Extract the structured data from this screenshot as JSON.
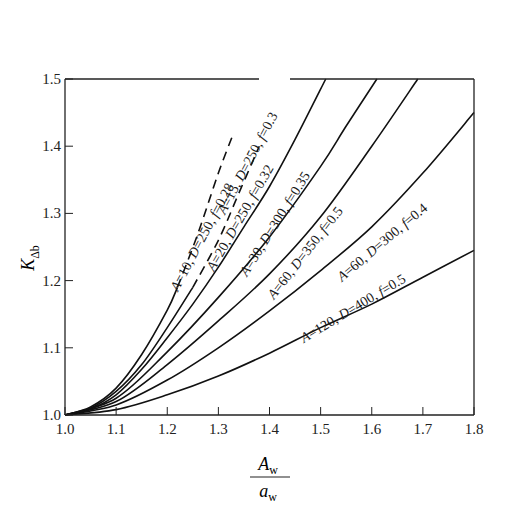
{
  "chart_data": {
    "type": "line",
    "title": "",
    "xlabel": "A_w / a_w",
    "xlabel_parts": {
      "numerator": "A",
      "numerator_sub": "w",
      "denominator": "a",
      "denominator_sub": "w"
    },
    "ylabel": "K_Δb",
    "ylabel_parts": {
      "main": "K",
      "sub": "Δb"
    },
    "xlim": [
      1.0,
      1.8
    ],
    "ylim": [
      1.0,
      1.5
    ],
    "x_ticks": [
      "1.0",
      "1.1",
      "1.2",
      "1.3",
      "1.4",
      "1.5",
      "1.6",
      "1.7",
      "1.8"
    ],
    "y_ticks": [
      "1.0",
      "1.1",
      "1.2",
      "1.3",
      "1.4",
      "1.5"
    ],
    "grid": false,
    "legend": "inline labels along curves",
    "series": [
      {
        "name": "A=10, D=250, f=0.28",
        "A": 10,
        "D": 250,
        "f": 0.28,
        "x": [
          1.0,
          1.05,
          1.1,
          1.15,
          1.2,
          1.22,
          1.26,
          1.3,
          1.33
        ],
        "values": [
          1.0,
          1.012,
          1.04,
          1.09,
          1.156,
          1.19,
          1.27,
          1.36,
          1.42
        ],
        "style": "solid to x≈1.22, dashed beyond",
        "dash_from_x": 1.22
      },
      {
        "name": "A=15, D=250, f=0.3",
        "A": 15,
        "D": 250,
        "f": 0.3,
        "x": [
          1.0,
          1.05,
          1.1,
          1.15,
          1.2,
          1.25,
          1.3,
          1.34,
          1.38
        ],
        "values": [
          1.0,
          1.01,
          1.035,
          1.075,
          1.13,
          1.19,
          1.26,
          1.33,
          1.4
        ],
        "style": "solid to x≈1.28, dashed beyond",
        "dash_from_x": 1.28
      },
      {
        "name": "A=20, D=250, f=0.32",
        "A": 20,
        "D": 250,
        "f": 0.32,
        "x": [
          1.0,
          1.05,
          1.1,
          1.15,
          1.2,
          1.25,
          1.3,
          1.35,
          1.4,
          1.45,
          1.51
        ],
        "values": [
          1.0,
          1.009,
          1.03,
          1.068,
          1.115,
          1.165,
          1.22,
          1.28,
          1.34,
          1.41,
          1.5
        ],
        "style": "solid"
      },
      {
        "name": "A=30, D=300, f=0.35",
        "A": 30,
        "D": 300,
        "f": 0.35,
        "x": [
          1.0,
          1.1,
          1.2,
          1.3,
          1.4,
          1.5,
          1.55,
          1.61
        ],
        "values": [
          1.0,
          1.025,
          1.094,
          1.175,
          1.265,
          1.37,
          1.43,
          1.5
        ],
        "style": "solid"
      },
      {
        "name": "A=60, D=350, f=0.5",
        "A": 60,
        "D": 350,
        "f": 0.5,
        "x": [
          1.0,
          1.1,
          1.2,
          1.3,
          1.4,
          1.5,
          1.6,
          1.69
        ],
        "values": [
          1.0,
          1.02,
          1.075,
          1.14,
          1.21,
          1.295,
          1.4,
          1.5
        ],
        "style": "solid"
      },
      {
        "name": "A=60, D=300, f=0.4",
        "A": 60,
        "D": 300,
        "f": 0.4,
        "x": [
          1.0,
          1.1,
          1.2,
          1.3,
          1.4,
          1.5,
          1.6,
          1.7,
          1.8
        ],
        "values": [
          1.0,
          1.015,
          1.052,
          1.1,
          1.155,
          1.215,
          1.28,
          1.36,
          1.45
        ],
        "style": "solid"
      },
      {
        "name": "A=120, D=400, f=0.5",
        "A": 120,
        "D": 400,
        "f": 0.5,
        "x": [
          1.0,
          1.1,
          1.2,
          1.3,
          1.4,
          1.5,
          1.6,
          1.7,
          1.8
        ],
        "values": [
          1.0,
          1.008,
          1.03,
          1.058,
          1.092,
          1.13,
          1.165,
          1.205,
          1.245
        ],
        "style": "solid"
      }
    ]
  },
  "labels": {
    "curves": [
      {
        "A": "A=10,",
        "D": "D=250,",
        "f": "f=0.28"
      },
      {
        "A": "A=15,",
        "D": "D=250,",
        "f": "f=0.3"
      },
      {
        "A": "A=20,",
        "D": "D=250,",
        "f": "f=0.32"
      },
      {
        "A": "A=30,",
        "D": "D=300,",
        "f": "f=0.35"
      },
      {
        "A": "A=60,",
        "D": "D=350,",
        "f": "f=0.5"
      },
      {
        "A": "A=60,",
        "D": "D=300,",
        "f": "f=0.4"
      },
      {
        "A": "A=120,",
        "D": "D=400,",
        "f": "f=0.5"
      }
    ]
  }
}
